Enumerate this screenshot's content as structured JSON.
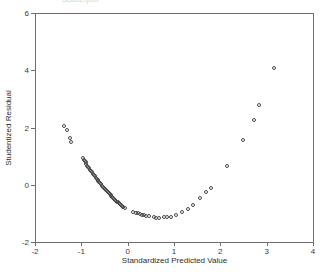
{
  "title_fragment": "Scatterplot",
  "chart_data": {
    "type": "scatter",
    "title": "",
    "xlabel": "Standardized Predicted Value",
    "ylabel": "Studentized Residual",
    "xlim": [
      -2,
      4
    ],
    "ylim": [
      -2,
      6
    ],
    "xticks": [
      -2,
      -1,
      0,
      1,
      2,
      3,
      4
    ],
    "xticklabels": [
      "-2",
      "-1",
      "0",
      "1",
      "2",
      "3",
      "4"
    ],
    "yticks": [
      -2,
      0,
      2,
      4,
      6
    ],
    "yticklabels": [
      "-2",
      "0",
      "2",
      "4",
      "6"
    ],
    "grid": false,
    "legend": false,
    "marker": "open-circle",
    "marker_color": "#4a4a4a",
    "points": [
      [
        -1.37,
        2.06
      ],
      [
        -1.32,
        1.9
      ],
      [
        -1.25,
        1.62
      ],
      [
        -1.22,
        1.5
      ],
      [
        -0.97,
        0.95
      ],
      [
        -0.95,
        0.88
      ],
      [
        -0.93,
        0.83
      ],
      [
        -0.91,
        0.78
      ],
      [
        -0.89,
        0.72
      ],
      [
        -0.87,
        0.67
      ],
      [
        -0.85,
        0.62
      ],
      [
        -0.83,
        0.57
      ],
      [
        -0.81,
        0.52
      ],
      [
        -0.79,
        0.47
      ],
      [
        -0.77,
        0.43
      ],
      [
        -0.75,
        0.38
      ],
      [
        -0.73,
        0.34
      ],
      [
        -0.71,
        0.29
      ],
      [
        -0.69,
        0.25
      ],
      [
        -0.67,
        0.21
      ],
      [
        -0.65,
        0.17
      ],
      [
        -0.63,
        0.13
      ],
      [
        -0.61,
        0.09
      ],
      [
        -0.59,
        0.05
      ],
      [
        -0.57,
        0.01
      ],
      [
        -0.55,
        -0.03
      ],
      [
        -0.53,
        -0.07
      ],
      [
        -0.51,
        -0.11
      ],
      [
        -0.49,
        -0.15
      ],
      [
        -0.47,
        -0.19
      ],
      [
        -0.45,
        -0.23
      ],
      [
        -0.43,
        -0.27
      ],
      [
        -0.41,
        -0.3
      ],
      [
        -0.39,
        -0.34
      ],
      [
        -0.37,
        -0.37
      ],
      [
        -0.35,
        -0.41
      ],
      [
        -0.33,
        -0.44
      ],
      [
        -0.31,
        -0.47
      ],
      [
        -0.29,
        -0.5
      ],
      [
        -0.27,
        -0.53
      ],
      [
        -0.25,
        -0.56
      ],
      [
        -0.23,
        -0.59
      ],
      [
        -0.21,
        -0.62
      ],
      [
        -0.19,
        -0.65
      ],
      [
        -0.17,
        -0.68
      ],
      [
        -0.15,
        -0.71
      ],
      [
        -0.13,
        -0.74
      ],
      [
        -0.11,
        -0.77
      ],
      [
        -0.09,
        -0.79
      ],
      [
        -0.06,
        -0.82
      ],
      [
        0.12,
        -0.95
      ],
      [
        0.17,
        -0.97
      ],
      [
        0.22,
        -0.99
      ],
      [
        0.27,
        -1.01
      ],
      [
        0.32,
        -1.04
      ],
      [
        0.36,
        -1.06
      ],
      [
        0.4,
        -1.08
      ],
      [
        0.45,
        -1.1
      ],
      [
        0.56,
        -1.14
      ],
      [
        0.61,
        -1.15
      ],
      [
        0.67,
        -1.15
      ],
      [
        0.78,
        -1.14
      ],
      [
        0.84,
        -1.13
      ],
      [
        0.93,
        -1.11
      ],
      [
        1.05,
        -1.05
      ],
      [
        1.18,
        -0.96
      ],
      [
        1.31,
        -0.86
      ],
      [
        1.42,
        -0.72
      ],
      [
        1.57,
        -0.45
      ],
      [
        1.69,
        -0.27
      ],
      [
        1.79,
        -0.1
      ],
      [
        2.15,
        0.65
      ],
      [
        2.48,
        1.56
      ],
      [
        2.72,
        2.25
      ],
      [
        2.83,
        2.78
      ],
      [
        3.15,
        4.08
      ]
    ]
  }
}
